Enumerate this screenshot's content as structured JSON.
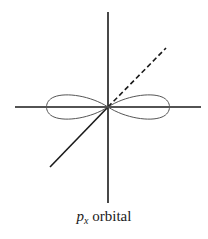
{
  "figure": {
    "caption": {
      "symbol": "p",
      "subscript": "x",
      "text": "orbital"
    },
    "axes": [
      "vertical-axis",
      "horizontal-axis",
      "diagonal-axis"
    ],
    "orbital": "p_x",
    "colors": {
      "line": "#1a1a1a",
      "lobe": "#555555",
      "background": "#ffffff"
    }
  }
}
